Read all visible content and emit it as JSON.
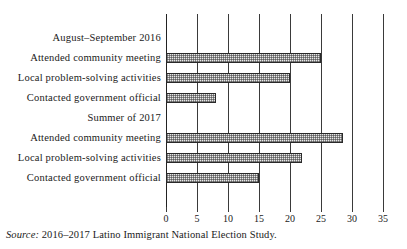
{
  "figure": {
    "source_note_label": "Source:",
    "source_note_text": " 2016–2017 Latino Immigrant National Election Study.",
    "title_remnant": ""
  },
  "chart_data": {
    "type": "bar",
    "orientation": "horizontal",
    "title": "",
    "xlabel": "",
    "ylabel": "",
    "xlim": [
      0,
      35
    ],
    "xticks": [
      0,
      5,
      10,
      15,
      20,
      25,
      30,
      35
    ],
    "xtick_labels": [
      "0",
      "5",
      "10",
      "15",
      "20",
      "25",
      "30",
      "35"
    ],
    "grid": true,
    "grid_axis": "x",
    "legend": false,
    "bar_style": {
      "fill": "checkerboard-hatch",
      "fill_color": "#e9e9e9",
      "edge_color": "#2a2a2a"
    },
    "groups": [
      {
        "label": "August–September 2016",
        "categories": [
          "Attended community meeting",
          "Local problem-solving activities",
          "Contacted government official"
        ],
        "values": [
          25,
          20,
          8
        ]
      },
      {
        "label": "Summer of 2017",
        "categories": [
          "Attended community meeting",
          "Local problem-solving activities",
          "Contacted government official"
        ],
        "values": [
          28.5,
          22,
          15
        ]
      }
    ],
    "rows": [
      {
        "label": "August–September 2016",
        "value": null,
        "is_group_header": true
      },
      {
        "label": "Attended community meeting",
        "value": 25,
        "is_group_header": false
      },
      {
        "label": "Local problem-solving activities",
        "value": 20,
        "is_group_header": false
      },
      {
        "label": "Contacted government official",
        "value": 8,
        "is_group_header": false
      },
      {
        "label": "Summer of 2017",
        "value": null,
        "is_group_header": true
      },
      {
        "label": "Attended community meeting",
        "value": 28.5,
        "is_group_header": false
      },
      {
        "label": "Local problem-solving activities",
        "value": 22,
        "is_group_header": false
      },
      {
        "label": "Contacted government official",
        "value": 15,
        "is_group_header": false
      }
    ]
  }
}
